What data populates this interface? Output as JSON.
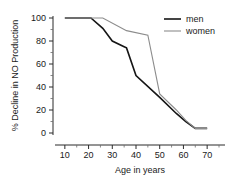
{
  "chart_data": {
    "type": "line",
    "title": "",
    "xlabel": "Age in years",
    "ylabel": "% Decline in NO Production",
    "xlim": [
      5,
      75
    ],
    "ylim": [
      0,
      100
    ],
    "grid": false,
    "legend_position": "top-right",
    "xticks": [
      10,
      20,
      30,
      40,
      50,
      60,
      70
    ],
    "yticks": [
      0,
      20,
      40,
      60,
      80,
      100
    ],
    "xtick_labels": [
      "10",
      "20",
      "30",
      "40",
      "50",
      "60",
      "70"
    ],
    "ytick_labels": [
      "0",
      "20",
      "40",
      "60",
      "80",
      "100"
    ],
    "x_minor_interval": 5,
    "y_minor_interval": 10,
    "series": [
      {
        "name": "men",
        "color": "#151515",
        "line_width": 1.6,
        "x": [
          10,
          21,
          26,
          30,
          35,
          36,
          40,
          50,
          57,
          61,
          65,
          70
        ],
        "values": [
          100,
          100,
          91,
          80,
          75,
          74,
          50,
          31,
          17,
          10,
          4,
          4
        ]
      },
      {
        "name": "women",
        "color": "#8c8c8c",
        "line_width": 1.1,
        "x": [
          10,
          26,
          36,
          45,
          50,
          57,
          61,
          65,
          70
        ],
        "values": [
          100,
          100,
          89,
          85,
          34,
          20,
          11,
          4,
          4
        ]
      }
    ]
  },
  "legend": {
    "items": [
      {
        "label": "men",
        "color": "#151515"
      },
      {
        "label": "women",
        "color": "#8c8c8c"
      }
    ]
  }
}
